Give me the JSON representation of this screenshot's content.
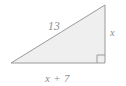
{
  "figure": {
    "shape_name": "right-triangle",
    "fill_color": "#efefef",
    "stroke_color": "#9a9a9a",
    "label_color": "#8e8e8e",
    "background_color": "#ffffff",
    "vertices": {
      "left": [
        11,
        63
      ],
      "top_right": [
        105,
        5
      ],
      "bottom_right": [
        105,
        63
      ]
    },
    "right_angle_marker": {
      "present": true,
      "corner": "bottom-right",
      "size": 8
    },
    "labels": {
      "hypotenuse": "13",
      "vertical_leg": "x",
      "base": "x + 7"
    }
  }
}
